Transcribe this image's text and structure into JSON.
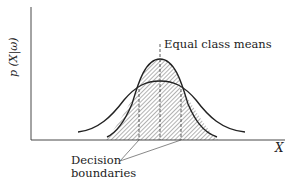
{
  "figure": {
    "y_axis_label": "p (X|ω)",
    "x_axis_label": "X",
    "annotations": {
      "means": "Equal class means",
      "boundaries_line1": "Decision",
      "boundaries_line2": "boundaries"
    },
    "curves": [
      {
        "name": "broad-distribution",
        "description": "wide normal density, lower peak"
      },
      {
        "name": "narrow-distribution",
        "description": "narrow normal density, higher peak"
      }
    ],
    "shading": "hatched regions under curves",
    "colors": {
      "ink": "#222222",
      "background": "#ffffff"
    }
  }
}
